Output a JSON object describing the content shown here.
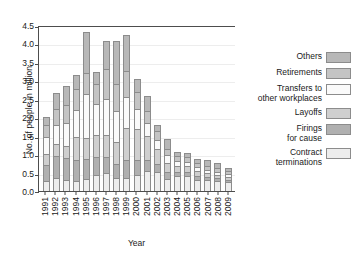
{
  "chart_data": {
    "type": "bar",
    "subtype": "stacked-bar",
    "title": "",
    "xlabel": "Year",
    "ylabel": "No. of people in million",
    "ylim": [
      0.0,
      4.5
    ],
    "yticks": [
      "0.0",
      "0.5",
      "1.0",
      "1.5",
      "2.0",
      "2.5",
      "3.0",
      "3.5",
      "4.0",
      "4.5"
    ],
    "grid": true,
    "legend_position": "right",
    "categories": [
      "1991",
      "1992",
      "1993",
      "1994",
      "1995",
      "1996",
      "1997",
      "1998",
      "1999",
      "2000",
      "2001",
      "2002",
      "2003",
      "2004",
      "2005",
      "2006",
      "2007",
      "2008",
      "2009"
    ],
    "series": [
      {
        "name": "Contract terminations",
        "color": "#ededed",
        "values": [
          0.25,
          0.32,
          0.27,
          0.26,
          0.3,
          0.41,
          0.46,
          0.33,
          0.33,
          0.41,
          0.52,
          0.5,
          0.3,
          0.38,
          0.4,
          0.28,
          0.27,
          0.25,
          0.22
        ]
      },
      {
        "name": "Firings for cause",
        "color": "#b0b0b0",
        "values": [
          0.43,
          0.6,
          0.6,
          0.57,
          0.55,
          0.49,
          0.45,
          0.37,
          0.48,
          0.41,
          0.31,
          0.22,
          0.19,
          0.12,
          0.11,
          0.12,
          0.09,
          0.08,
          0.07
        ]
      },
      {
        "name": "Layoffs",
        "color": "#cfcfcf",
        "values": [
          0.3,
          0.33,
          0.33,
          0.62,
          0.58,
          0.6,
          0.6,
          0.6,
          0.87,
          0.85,
          0.65,
          0.4,
          0.27,
          0.17,
          0.16,
          0.14,
          0.11,
          0.1,
          0.09
        ]
      },
      {
        "name": "Transfers to other workplaces",
        "color": "#fafafa",
        "values": [
          0.48,
          0.53,
          0.63,
          0.75,
          1.19,
          0.86,
          0.97,
          0.85,
          0.87,
          0.54,
          0.37,
          0.26,
          0.2,
          0.13,
          0.12,
          0.11,
          0.1,
          0.09,
          0.08
        ]
      },
      {
        "name": "Retirements",
        "color": "#c4c4c4",
        "values": [
          0.33,
          0.44,
          0.5,
          0.55,
          0.57,
          0.54,
          0.83,
          0.74,
          0.69,
          0.47,
          0.31,
          0.24,
          0.18,
          0.14,
          0.13,
          0.12,
          0.11,
          0.1,
          0.08
        ]
      },
      {
        "name": "Others",
        "color": "#b8b8b8",
        "values": [
          0.22,
          0.45,
          0.52,
          0.4,
          1.12,
          0.32,
          0.75,
          1.17,
          0.98,
          0.36,
          0.41,
          0.18,
          0.27,
          0.12,
          0.12,
          0.11,
          0.16,
          0.13,
          0.08
        ]
      }
    ],
    "totals": [
      2.01,
      2.67,
      2.85,
      3.15,
      4.31,
      3.22,
      4.06,
      4.06,
      4.22,
      3.04,
      2.57,
      1.8,
      1.41,
      1.06,
      1.04,
      0.88,
      0.84,
      0.75,
      0.62
    ]
  },
  "legend": {
    "items": [
      {
        "label": "Others",
        "lines": [
          "Others"
        ]
      },
      {
        "label": "Retirements",
        "lines": [
          "Retirements"
        ]
      },
      {
        "label": "Transfers to other workplaces",
        "lines": [
          "Transfers to",
          "other workplaces"
        ]
      },
      {
        "label": "Layoffs",
        "lines": [
          "Layoffs"
        ]
      },
      {
        "label": "Firings for cause",
        "lines": [
          "Firings",
          "for cause"
        ]
      },
      {
        "label": "Contract terminations",
        "lines": [
          "Contract",
          "terminations"
        ]
      }
    ]
  },
  "colors": {
    "axis": "#4d4d4d",
    "grid": "#ededed",
    "edge": "#8c8c8c",
    "text": "#1a1a1a",
    "background": "#ffffff"
  }
}
